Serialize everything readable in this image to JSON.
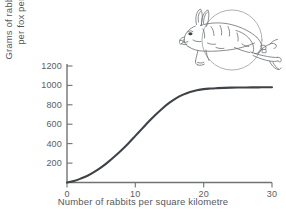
{
  "chart_data": {
    "type": "line",
    "title": "",
    "subtitle": "",
    "xlabel": "Number of rabbits per square kilometre",
    "ylabel": "Grams of rabbit eaten per fox per day",
    "ylabel_line1": "Grams of rabbit eaten",
    "ylabel_line2": "per fox per day",
    "xlim": [
      0,
      30
    ],
    "ylim": [
      0,
      1200
    ],
    "xticks": [
      "0",
      "10",
      "20",
      "30"
    ],
    "xtick_values": [
      0,
      10,
      20,
      30
    ],
    "yticks": [
      "200",
      "400",
      "600",
      "800",
      "1000",
      "1200"
    ],
    "ytick_values": [
      200,
      400,
      600,
      800,
      1000,
      1200
    ],
    "grid": false,
    "legend": false,
    "legend_position": "none",
    "curve_color": "#3f4347",
    "axis_color": "#7b7f82",
    "background": "#ffffff",
    "series": [
      {
        "name": "Type III functional response",
        "x": [
          0,
          1,
          2,
          3,
          4,
          5,
          6,
          7,
          8,
          9,
          10,
          11,
          12,
          13,
          14,
          15,
          16,
          17,
          18,
          19,
          20,
          21,
          22,
          23,
          24,
          25,
          26,
          27,
          28,
          29,
          30
        ],
        "values": [
          0,
          15,
          40,
          70,
          110,
          155,
          210,
          270,
          335,
          405,
          480,
          555,
          630,
          700,
          765,
          822,
          870,
          905,
          932,
          950,
          962,
          968,
          972,
          975,
          977,
          978,
          979,
          980,
          980,
          981,
          981
        ]
      }
    ],
    "annotations": [
      {
        "name": "rabbit-illustration",
        "description": "line drawing of a leaping rabbit inside a circle"
      }
    ]
  },
  "figure": {
    "illustration_label": "rabbit-illustration"
  }
}
